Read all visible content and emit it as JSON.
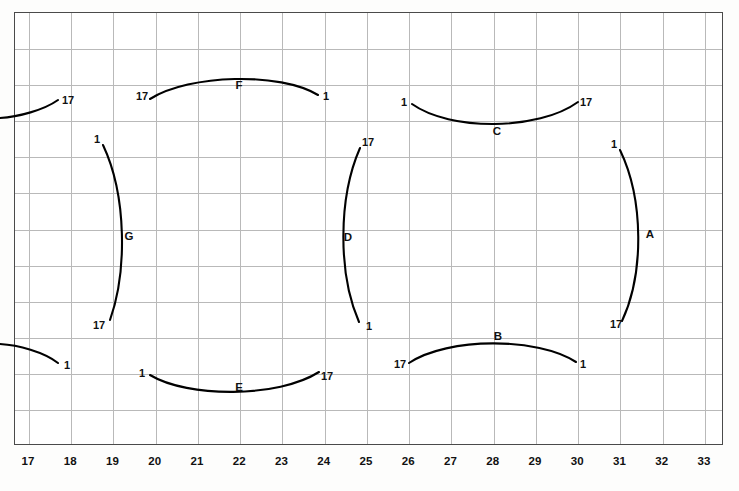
{
  "chart_data": {
    "type": "line",
    "title": "",
    "xlabel": "",
    "ylabel": "",
    "grid": true,
    "xlim": [
      16.67,
      33.45
    ],
    "x_ticks": [
      17,
      18,
      19,
      20,
      21,
      22,
      23,
      24,
      25,
      26,
      27,
      28,
      29,
      30,
      31,
      32,
      33
    ],
    "x_tick_labels": [
      "17",
      "18",
      "19",
      "20",
      "21",
      "22",
      "23",
      "24",
      "25",
      "26",
      "27",
      "28",
      "29",
      "30",
      "31",
      "32",
      "33"
    ],
    "grid_columns": 17,
    "grid_rows": 12,
    "endpoint_value_low": "1",
    "endpoint_value_high": "17",
    "curves": [
      {
        "name": "F",
        "orientation": "horizontal-arc-up",
        "start_label": "17",
        "end_label": "1",
        "name_label_x": 239,
        "name_label_y": 85,
        "start_label_x": 142,
        "start_label_y": 96,
        "end_label_x": 326,
        "end_label_y": 96,
        "path": "M 150 99 C 190 74, 280 72, 318 95"
      },
      {
        "name": "C",
        "orientation": "horizontal-arc-down",
        "start_label": "1",
        "end_label": "17",
        "name_label_x": 497,
        "name_label_y": 131,
        "start_label_x": 404,
        "start_label_y": 102,
        "end_label_x": 586,
        "end_label_y": 102,
        "path": "M 412 104 C 450 131, 538 131, 578 102"
      },
      {
        "name": "G",
        "orientation": "vertical-arc-right",
        "start_label": "1",
        "end_label": "17",
        "name_label_x": 129,
        "name_label_y": 236,
        "start_label_x": 97,
        "start_label_y": 139,
        "end_label_x": 99,
        "end_label_y": 325,
        "path": "M 103 145 C 127 196, 127 272, 110 320"
      },
      {
        "name": "D",
        "orientation": "vertical-arc-left",
        "start_label": "17",
        "end_label": "1",
        "name_label_x": 348,
        "name_label_y": 237,
        "start_label_x": 368,
        "start_label_y": 142,
        "end_label_x": 369,
        "end_label_y": 326,
        "path": "M 360 148 C 338 198, 338 274, 359 322"
      },
      {
        "name": "A",
        "orientation": "vertical-arc-right",
        "start_label": "1",
        "end_label": "17",
        "name_label_x": 650,
        "name_label_y": 234,
        "start_label_x": 614,
        "start_label_y": 144,
        "end_label_x": 616,
        "end_label_y": 324,
        "path": "M 620 150 C 644 200, 644 274, 622 321"
      },
      {
        "name": "B",
        "orientation": "horizontal-arc-up",
        "start_label": "17",
        "end_label": "1",
        "name_label_x": 498,
        "name_label_y": 336,
        "start_label_x": 400,
        "start_label_y": 364,
        "end_label_x": 583,
        "end_label_y": 364,
        "path": "M 409 363 C 448 337, 538 337, 576 362"
      },
      {
        "name": "E",
        "orientation": "horizontal-arc-down",
        "start_label": "1",
        "end_label": "17",
        "name_label_x": 239,
        "name_label_y": 387,
        "start_label_x": 142,
        "start_label_y": 373,
        "end_label_x": 327,
        "end_label_y": 376,
        "path": "M 150 375 C 188 398, 278 398, 319 372"
      },
      {
        "name": "",
        "orientation": "partial-edge-top-left",
        "start_label": "",
        "end_label": "17",
        "name_label_x": null,
        "name_label_y": null,
        "start_label_x": null,
        "start_label_y": null,
        "end_label_x": 68,
        "end_label_y": 100,
        "path": "M 0 118 C 18 117, 44 110, 58 100"
      },
      {
        "name": "",
        "orientation": "partial-edge-bottom-left",
        "start_label": "",
        "end_label": "1",
        "name_label_x": null,
        "name_label_y": null,
        "start_label_x": null,
        "start_label_y": null,
        "end_label_x": 67,
        "end_label_y": 365,
        "path": "M 0 344 C 18 345, 44 352, 58 363"
      }
    ]
  }
}
